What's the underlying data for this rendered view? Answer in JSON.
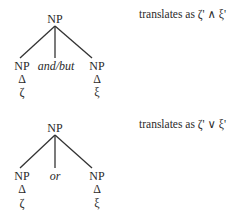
{
  "trees": [
    {
      "root": "NP",
      "children": [
        {
          "label": "NP",
          "triangle": "Δ",
          "leaf": "ζ"
        },
        {
          "label": "and/but"
        },
        {
          "label": "NP",
          "triangle": "Δ",
          "leaf": "ξ"
        }
      ],
      "translation": "translates as ζ' ∧ ξ'"
    },
    {
      "root": "NP",
      "children": [
        {
          "label": "NP",
          "triangle": "Δ",
          "leaf": "ζ"
        },
        {
          "label": "or"
        },
        {
          "label": "NP",
          "triangle": "Δ",
          "leaf": "ξ"
        }
      ],
      "translation": "translates as ζ' ∨ ξ'"
    }
  ],
  "colors": {
    "ink": "#2a2a2a",
    "background": "#ffffff"
  }
}
